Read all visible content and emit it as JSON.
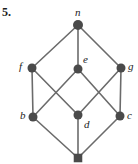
{
  "figure": {
    "exercise_number": "5.",
    "caption": "",
    "width": 138,
    "height": 164,
    "background_color": "#ffffff",
    "node_color": "#4a4a4a",
    "edge_color": "#6b6b6b",
    "label_color": "#1c1c1c"
  },
  "graph_data": {
    "type": "hasse-diagram",
    "description": "Lattice Hasse diagram with top element n, bottom element (unlabeled), middle layers f, e, g and b, d, c",
    "nodes": [
      {
        "id": "n",
        "label": "n",
        "x": 78,
        "y": 25,
        "radius": 5,
        "shape": "circle",
        "label_x": 75,
        "label_y": 7,
        "label_anchor": "above"
      },
      {
        "id": "f",
        "label": "f",
        "x": 32,
        "y": 68,
        "radius": 4.5,
        "shape": "circle",
        "label_x": 19,
        "label_y": 61,
        "label_anchor": "left"
      },
      {
        "id": "e",
        "label": "e",
        "x": 78,
        "y": 69,
        "radius": 4.5,
        "shape": "circle",
        "label_x": 83,
        "label_y": 54,
        "label_anchor": "above-right"
      },
      {
        "id": "g",
        "label": "g",
        "x": 121,
        "y": 68,
        "radius": 4.5,
        "shape": "circle",
        "label_x": 128,
        "label_y": 61,
        "label_anchor": "right"
      },
      {
        "id": "b",
        "label": "b",
        "x": 33,
        "y": 117,
        "radius": 4.5,
        "shape": "circle",
        "label_x": 20,
        "label_y": 110,
        "label_anchor": "left"
      },
      {
        "id": "d",
        "label": "d",
        "x": 78,
        "y": 115,
        "radius": 4.5,
        "shape": "circle",
        "label_x": 84,
        "label_y": 119,
        "label_anchor": "below-right"
      },
      {
        "id": "c",
        "label": "c",
        "x": 120,
        "y": 116,
        "radius": 4.5,
        "shape": "circle",
        "label_x": 127,
        "label_y": 110,
        "label_anchor": "right"
      },
      {
        "id": "bottom",
        "label": "",
        "x": 78,
        "y": 158,
        "radius": 4.5,
        "shape": "square",
        "label_x": 0,
        "label_y": 0,
        "label_anchor": "none"
      }
    ],
    "edges": [
      {
        "from": "n",
        "to": "f"
      },
      {
        "from": "n",
        "to": "e"
      },
      {
        "from": "n",
        "to": "g"
      },
      {
        "from": "f",
        "to": "b"
      },
      {
        "from": "f",
        "to": "d"
      },
      {
        "from": "e",
        "to": "b"
      },
      {
        "from": "e",
        "to": "c"
      },
      {
        "from": "g",
        "to": "d"
      },
      {
        "from": "g",
        "to": "c"
      },
      {
        "from": "b",
        "to": "bottom"
      },
      {
        "from": "d",
        "to": "bottom"
      },
      {
        "from": "c",
        "to": "bottom"
      }
    ]
  }
}
